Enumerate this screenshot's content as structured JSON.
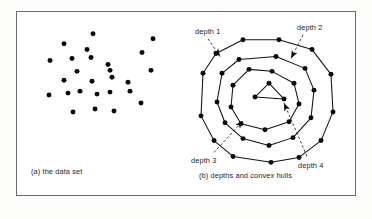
{
  "figure": {
    "panels": [
      {
        "id": "panel-a",
        "caption": "(a) the data set",
        "points": [
          {
            "x": 76,
            "y": 22
          },
          {
            "x": 47,
            "y": 32
          },
          {
            "x": 136,
            "y": 27
          },
          {
            "x": 70,
            "y": 38
          },
          {
            "x": 125,
            "y": 41
          },
          {
            "x": 33,
            "y": 49
          },
          {
            "x": 55,
            "y": 47
          },
          {
            "x": 74,
            "y": 46
          },
          {
            "x": 91,
            "y": 53
          },
          {
            "x": 60,
            "y": 60
          },
          {
            "x": 93,
            "y": 59
          },
          {
            "x": 134,
            "y": 59
          },
          {
            "x": 47,
            "y": 69
          },
          {
            "x": 75,
            "y": 70
          },
          {
            "x": 95,
            "y": 66
          },
          {
            "x": 111,
            "y": 71
          },
          {
            "x": 32,
            "y": 84
          },
          {
            "x": 51,
            "y": 82
          },
          {
            "x": 63,
            "y": 80
          },
          {
            "x": 80,
            "y": 83
          },
          {
            "x": 93,
            "y": 81
          },
          {
            "x": 113,
            "y": 80
          },
          {
            "x": 124,
            "y": 92
          },
          {
            "x": 56,
            "y": 101
          },
          {
            "x": 78,
            "y": 98
          },
          {
            "x": 97,
            "y": 100
          }
        ]
      },
      {
        "id": "panel-b",
        "caption": "(b) depths and convex hulls",
        "hulls": [
          {
            "depth": 1,
            "label": "depth 1",
            "points": [
              {
                "x": 62,
                "y": 28
              },
              {
                "x": 35,
                "y": 42
              },
              {
                "x": 22,
                "y": 62
              },
              {
                "x": 20,
                "y": 105
              },
              {
                "x": 33,
                "y": 130
              },
              {
                "x": 52,
                "y": 146
              },
              {
                "x": 90,
                "y": 152
              },
              {
                "x": 118,
                "y": 147
              },
              {
                "x": 140,
                "y": 130
              },
              {
                "x": 152,
                "y": 101
              },
              {
                "x": 150,
                "y": 63
              },
              {
                "x": 131,
                "y": 38
              },
              {
                "x": 98,
                "y": 28
              }
            ]
          },
          {
            "depth": 2,
            "label": "depth 2",
            "points": [
              {
                "x": 58,
                "y": 48
              },
              {
                "x": 41,
                "y": 62
              },
              {
                "x": 36,
                "y": 91
              },
              {
                "x": 44,
                "y": 112
              },
              {
                "x": 62,
                "y": 128
              },
              {
                "x": 88,
                "y": 135
              },
              {
                "x": 112,
                "y": 127
              },
              {
                "x": 130,
                "y": 107
              },
              {
                "x": 133,
                "y": 79
              },
              {
                "x": 124,
                "y": 57
              },
              {
                "x": 95,
                "y": 45
              }
            ]
          },
          {
            "depth": 3,
            "label": "depth 3",
            "points": [
              {
                "x": 68,
                "y": 58
              },
              {
                "x": 52,
                "y": 74
              },
              {
                "x": 50,
                "y": 96
              },
              {
                "x": 60,
                "y": 113
              },
              {
                "x": 84,
                "y": 119
              },
              {
                "x": 108,
                "y": 111
              },
              {
                "x": 118,
                "y": 93
              },
              {
                "x": 113,
                "y": 72
              },
              {
                "x": 91,
                "y": 60
              }
            ]
          },
          {
            "depth": 4,
            "label": "depth 4",
            "points": [
              {
                "x": 74,
                "y": 86
              },
              {
                "x": 88,
                "y": 72
              },
              {
                "x": 103,
                "y": 88
              }
            ]
          }
        ],
        "leaders": [
          {
            "name": "leader-depth-1",
            "path": "M 27,27 L 39,45",
            "head": {
              "x": 39,
              "y": 45,
              "angle": 57
            }
          },
          {
            "name": "leader-depth-2",
            "path": "M 122,23 L 110,47",
            "head": {
              "x": 110,
              "y": 47,
              "angle": 117
            }
          },
          {
            "name": "leader-depth-3",
            "path": "M 33,142 L 62,110",
            "head": {
              "x": 62,
              "y": 110,
              "angle": -48
            }
          },
          {
            "name": "leader-depth-4",
            "path": "M 126,146 L 103,92",
            "head": {
              "x": 103,
              "y": 92,
              "angle": -113
            }
          }
        ]
      }
    ]
  },
  "style": {
    "frame_color": "#6b6b6b",
    "ink_color": "#111111",
    "page_background": "#fdfdfc",
    "panel_background": "#ffffff"
  }
}
